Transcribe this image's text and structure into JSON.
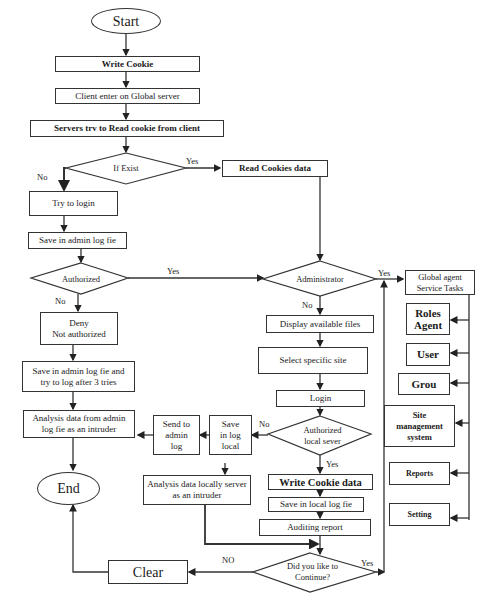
{
  "diagram": {
    "type": "flowchart",
    "terminals": {
      "start": "Start",
      "end": "End"
    },
    "process": {
      "write_cookie": "Write Cookie",
      "client_enter": "Client enter on Global server",
      "servers_read": "Servers trv to Read cookie from client",
      "read_cookies_data": "Read Cookies data",
      "try_login": "Try to login",
      "save_admin_log": "Save in admin log fie",
      "deny": "Deny\nNot authorized",
      "save_admin_log_tries": "Save in admin log fie and\ntry to log after 3 tries",
      "analysis_admin": "Analysis data from admin\nlog fie as an intruder",
      "send_admin_log": "Send to\nadmin\nlog",
      "save_log_local": "Save\nin log\nlocal",
      "analysis_local": "Analysis data locally server\nas an intruder",
      "display_files": "Display available files",
      "select_site": "Select specific site",
      "login": "Login",
      "write_cookie_data": "Write Cookie data",
      "save_local_log": "Save in local log fie",
      "auditing_report": "Auditing report",
      "clear": "Clear",
      "global_agent": "Global agent\nService Tasks",
      "roles_agent": "Roles\nAgent",
      "user": "User",
      "group": "Grou",
      "site_mgmt": "Site\nmanagement\nsystem",
      "reports": "Reports",
      "setting": "Setting"
    },
    "decisions": {
      "if_exist": "If Exist",
      "authorized": "Authorized",
      "administrator": "Administrator",
      "authorized_local": "Authorized\nlocal sever",
      "continue": "Did you like to\nContinue?"
    },
    "edge_labels": {
      "exist_yes": "Yes",
      "exist_no": "No",
      "auth_yes": "Yes",
      "auth_no": "No",
      "admin_yes": "Yes",
      "admin_no": "No",
      "local_no": "No",
      "local_yes": "Yes",
      "continue_no": "NO",
      "continue_yes": "Yes"
    }
  }
}
